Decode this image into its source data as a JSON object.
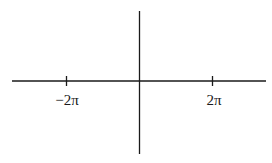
{
  "diagram": {
    "type": "coordinate-axes",
    "stroke_color": "#1a1a1a",
    "x_axis": {
      "ticks": [
        {
          "label": "−2π",
          "value": "-2pi"
        },
        {
          "label": "2π",
          "value": "2pi"
        }
      ]
    },
    "y_axis": {
      "ticks": []
    }
  }
}
